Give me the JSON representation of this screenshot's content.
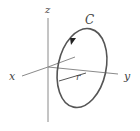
{
  "diagram": {
    "axes": {
      "x_label": "x",
      "y_label": "y",
      "z_label": "z"
    },
    "curve_label": "C",
    "radius_label": "r",
    "colors": {
      "axis": "#7a7a7a",
      "curve": "#555555",
      "label": "#444444",
      "background": "#ffffff"
    }
  }
}
